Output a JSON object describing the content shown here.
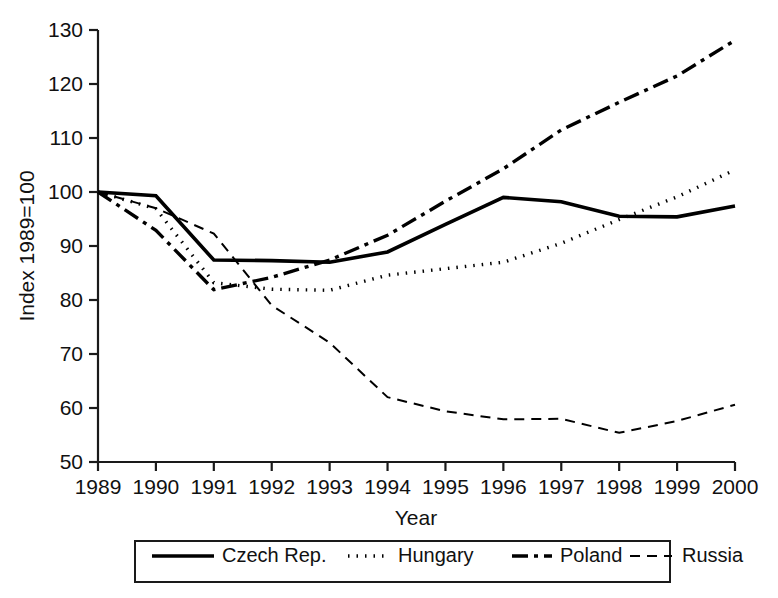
{
  "chart_data": {
    "type": "line",
    "title": "",
    "xlabel": "Year",
    "ylabel": "Index 1989=100",
    "grid": false,
    "legend_position": "bottom",
    "x": [
      1989,
      1990,
      1991,
      1992,
      1993,
      1994,
      1995,
      1996,
      1997,
      1998,
      1999,
      2000
    ],
    "xtick_labels": [
      "1989",
      "1990",
      "1991",
      "1992",
      "1993",
      "1994",
      "1995",
      "1996",
      "1997",
      "1998",
      "1999",
      "2000"
    ],
    "ytick_labels": [
      "50",
      "60",
      "70",
      "80",
      "90",
      "100",
      "110",
      "120",
      "130"
    ],
    "xlim": [
      1989,
      2000
    ],
    "ylim": [
      50,
      130
    ],
    "ystep": 10,
    "series": [
      {
        "name": "Czech Rep.",
        "style": "solid",
        "width": 3.6,
        "dash": "",
        "values": [
          100.0,
          99.3,
          87.4,
          87.3,
          87.0,
          88.9,
          94.0,
          99.0,
          98.2,
          95.5,
          95.4,
          97.4
        ]
      },
      {
        "name": "Hungary",
        "style": "dotted",
        "width": 3.4,
        "dash": "1.5 7",
        "values": [
          100.0,
          96.9,
          83.2,
          82.0,
          81.8,
          84.6,
          85.8,
          87.0,
          90.5,
          94.9,
          99.1,
          104.1
        ]
      },
      {
        "name": "Poland",
        "style": "dash-dot",
        "width": 3.4,
        "dash": "16 6 4 6",
        "values": [
          100.0,
          92.9,
          81.9,
          84.2,
          87.4,
          92.0,
          98.3,
          104.3,
          111.5,
          116.6,
          121.5,
          128.1
        ]
      },
      {
        "name": "Russia",
        "style": "dashed",
        "width": 2.0,
        "dash": "10 7",
        "values": [
          100.0,
          97.0,
          92.3,
          79.0,
          72.1,
          62.0,
          59.4,
          57.9,
          58.0,
          55.4,
          57.6,
          60.6
        ]
      }
    ]
  },
  "legend": {
    "entries": [
      {
        "label": "Czech Rep."
      },
      {
        "label": "Hungary"
      },
      {
        "label": "Poland"
      },
      {
        "label": "Russia"
      }
    ]
  }
}
